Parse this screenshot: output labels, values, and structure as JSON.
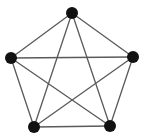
{
  "figure": {
    "background_color": "#ffffff",
    "width": 145,
    "height": 137
  },
  "style": {
    "vertex_color": "#111111",
    "vertex_radius": 6,
    "edge_color": "#5a5a5a",
    "edge_width": 1.3
  },
  "chart_data": {
    "type": "diagram",
    "graph_type": "complete-graph",
    "name": "K5",
    "vertex_count": 5,
    "edge_count": 10,
    "degree_per_vertex": 4,
    "vertices": [
      {
        "id": "v1",
        "label": "top",
        "x": 72,
        "y": 13
      },
      {
        "id": "v2",
        "label": "right",
        "x": 133,
        "y": 57
      },
      {
        "id": "v3",
        "label": "bottom-right",
        "x": 110,
        "y": 126
      },
      {
        "id": "v4",
        "label": "bottom-left",
        "x": 34,
        "y": 127
      },
      {
        "id": "v5",
        "label": "left",
        "x": 11,
        "y": 58
      }
    ],
    "edges": [
      {
        "from": "v1",
        "to": "v2",
        "kind": "pentagon-side"
      },
      {
        "from": "v2",
        "to": "v3",
        "kind": "pentagon-side"
      },
      {
        "from": "v3",
        "to": "v4",
        "kind": "pentagon-side"
      },
      {
        "from": "v4",
        "to": "v5",
        "kind": "pentagon-side"
      },
      {
        "from": "v5",
        "to": "v1",
        "kind": "pentagon-side"
      },
      {
        "from": "v1",
        "to": "v3",
        "kind": "pentagram-chord"
      },
      {
        "from": "v1",
        "to": "v4",
        "kind": "pentagram-chord"
      },
      {
        "from": "v2",
        "to": "v4",
        "kind": "pentagram-chord"
      },
      {
        "from": "v2",
        "to": "v5",
        "kind": "pentagram-chord"
      },
      {
        "from": "v3",
        "to": "v5",
        "kind": "pentagram-chord"
      }
    ]
  }
}
